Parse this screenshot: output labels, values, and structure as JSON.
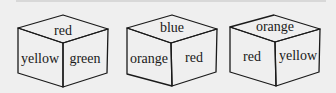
{
  "diagram": {
    "colors": {
      "background": "#efefef",
      "stroke": "#1a1a1a",
      "text": "#1a1a1a"
    },
    "cubes": [
      {
        "top": "red",
        "left": "yellow",
        "right": "green"
      },
      {
        "top": "blue",
        "left": "orange",
        "right": "red"
      },
      {
        "top": "orange",
        "left": "red",
        "right": "yellow"
      }
    ]
  }
}
